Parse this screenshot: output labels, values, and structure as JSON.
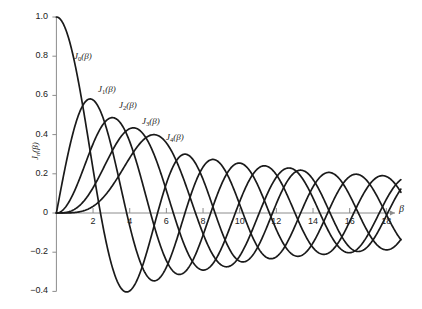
{
  "figure": {
    "title": "",
    "background_color": "#ffffff",
    "curve_color": "#1a1a1a",
    "axis_color": "#8c8c8c"
  },
  "axes": {
    "x": {
      "label": "β",
      "ticks": [
        2,
        4,
        6,
        8,
        10,
        12,
        14,
        16,
        18
      ],
      "tick_labels": [
        "2",
        "4",
        "6",
        "8",
        "10",
        "12",
        "14",
        "16",
        "18"
      ],
      "range": [
        0,
        18.8
      ]
    },
    "y": {
      "label_parts": {
        "J": "J",
        "sub": "n",
        "arg": "(β)"
      },
      "label": "Jₙ(β)",
      "ticks": [
        1.0,
        0.8,
        0.6,
        0.4,
        0.2,
        0,
        -0.2,
        -0.4
      ],
      "tick_labels": [
        "1.0",
        "0.8",
        "0.6",
        "0.4",
        "0.2",
        "0",
        "−0.2",
        "−0.4"
      ],
      "range": [
        -0.43,
        1.04
      ]
    }
  },
  "curve_labels": [
    {
      "name": "J0",
      "text": "J₀(β)",
      "base": "J",
      "sub": "0",
      "arg": "(β)",
      "x": 74,
      "y": 52
    },
    {
      "name": "J1",
      "text": "J₁(β)",
      "base": "J",
      "sub": "1",
      "arg": "(β)",
      "x": 98,
      "y": 85
    },
    {
      "name": "J2",
      "text": "J₂(β)",
      "base": "J",
      "sub": "2",
      "arg": "(β)",
      "x": 119,
      "y": 101
    },
    {
      "name": "J3",
      "text": "J₃(β)",
      "base": "J",
      "sub": "3",
      "arg": "(β)",
      "x": 142,
      "y": 117
    },
    {
      "name": "J4",
      "text": "J₄(β)",
      "base": "J",
      "sub": "4",
      "arg": "(β)",
      "x": 166,
      "y": 133
    }
  ],
  "chart_data": {
    "type": "line",
    "xlabel": "β",
    "ylabel": "Jₙ(β)",
    "xlim": [
      0,
      18.8
    ],
    "ylim": [
      -0.43,
      1.04
    ],
    "grid": false,
    "legend": "inline-curve-labels",
    "x_ticks": [
      2,
      4,
      6,
      8,
      10,
      12,
      14,
      16,
      18
    ],
    "y_ticks": [
      1.0,
      0.8,
      0.6,
      0.4,
      0.2,
      0,
      -0.2,
      -0.4
    ],
    "series": [
      {
        "name": "J0(β)",
        "order": 0,
        "first_max": {
          "x": 0,
          "y": 1.0
        },
        "zeros": [
          2.405,
          5.52,
          8.654,
          11.792,
          14.931,
          18.071
        ],
        "sample_points": [
          {
            "x": 0,
            "y": 1.0
          },
          {
            "x": 1,
            "y": 0.765
          },
          {
            "x": 2,
            "y": 0.224
          },
          {
            "x": 3,
            "y": -0.26
          },
          {
            "x": 4,
            "y": -0.397
          },
          {
            "x": 5,
            "y": -0.178
          },
          {
            "x": 6,
            "y": 0.151
          },
          {
            "x": 7,
            "y": 0.3
          },
          {
            "x": 8,
            "y": 0.172
          },
          {
            "x": 9,
            "y": -0.09
          },
          {
            "x": 10,
            "y": -0.246
          },
          {
            "x": 11,
            "y": -0.171
          },
          {
            "x": 12,
            "y": 0.048
          },
          {
            "x": 13,
            "y": 0.207
          },
          {
            "x": 14,
            "y": 0.171
          },
          {
            "x": 15,
            "y": -0.014
          },
          {
            "x": 16,
            "y": -0.175
          },
          {
            "x": 17,
            "y": -0.17
          },
          {
            "x": 18,
            "y": -0.013
          }
        ]
      },
      {
        "name": "J1(β)",
        "order": 1,
        "first_max": {
          "x": 1.841,
          "y": 0.581
        },
        "zeros": [
          0,
          3.832,
          7.016,
          10.174,
          13.324,
          16.471
        ],
        "sample_points": [
          {
            "x": 0,
            "y": 0.0
          },
          {
            "x": 1,
            "y": 0.44
          },
          {
            "x": 2,
            "y": 0.577
          },
          {
            "x": 3,
            "y": 0.339
          },
          {
            "x": 4,
            "y": -0.066
          },
          {
            "x": 5,
            "y": -0.328
          },
          {
            "x": 6,
            "y": -0.277
          },
          {
            "x": 7,
            "y": -0.005
          },
          {
            "x": 8,
            "y": 0.235
          },
          {
            "x": 9,
            "y": 0.245
          },
          {
            "x": 10,
            "y": 0.043
          },
          {
            "x": 11,
            "y": -0.177
          },
          {
            "x": 12,
            "y": -0.223
          },
          {
            "x": 13,
            "y": -0.07
          },
          {
            "x": 14,
            "y": 0.133
          },
          {
            "x": 15,
            "y": 0.205
          },
          {
            "x": 16,
            "y": 0.09
          },
          {
            "x": 17,
            "y": -0.098
          },
          {
            "x": 18,
            "y": -0.188
          }
        ]
      },
      {
        "name": "J2(β)",
        "order": 2,
        "first_max": {
          "x": 3.054,
          "y": 0.486
        },
        "zeros": [
          0,
          5.136,
          8.417,
          11.62,
          14.796,
          17.96
        ],
        "sample_points": [
          {
            "x": 0,
            "y": 0.0
          },
          {
            "x": 1,
            "y": 0.115
          },
          {
            "x": 2,
            "y": 0.353
          },
          {
            "x": 3,
            "y": 0.486
          },
          {
            "x": 4,
            "y": 0.364
          },
          {
            "x": 5,
            "y": 0.047
          },
          {
            "x": 6,
            "y": -0.243
          },
          {
            "x": 7,
            "y": -0.301
          },
          {
            "x": 8,
            "y": -0.113
          },
          {
            "x": 9,
            "y": 0.145
          },
          {
            "x": 10,
            "y": 0.255
          },
          {
            "x": 11,
            "y": 0.139
          },
          {
            "x": 12,
            "y": -0.085
          },
          {
            "x": 13,
            "y": -0.218
          },
          {
            "x": 14,
            "y": -0.152
          },
          {
            "x": 15,
            "y": 0.042
          },
          {
            "x": 16,
            "y": 0.186
          },
          {
            "x": 17,
            "y": 0.158
          },
          {
            "x": 18,
            "y": -0.008
          }
        ]
      },
      {
        "name": "J3(β)",
        "order": 3,
        "first_max": {
          "x": 4.201,
          "y": 0.434
        },
        "zeros": [
          0,
          6.38,
          9.761,
          13.015,
          16.223
        ],
        "sample_points": [
          {
            "x": 0,
            "y": 0.0
          },
          {
            "x": 1,
            "y": 0.02
          },
          {
            "x": 2,
            "y": 0.129
          },
          {
            "x": 3,
            "y": 0.309
          },
          {
            "x": 4,
            "y": 0.43
          },
          {
            "x": 5,
            "y": 0.365
          },
          {
            "x": 6,
            "y": 0.115
          },
          {
            "x": 7,
            "y": -0.168
          },
          {
            "x": 8,
            "y": -0.291
          },
          {
            "x": 9,
            "y": -0.181
          },
          {
            "x": 10,
            "y": 0.058
          },
          {
            "x": 11,
            "y": 0.227
          },
          {
            "x": 12,
            "y": 0.195
          },
          {
            "x": 13,
            "y": 0.003
          },
          {
            "x": 14,
            "y": -0.177
          },
          {
            "x": 15,
            "y": -0.194
          },
          {
            "x": 16,
            "y": -0.043
          },
          {
            "x": 17,
            "y": 0.135
          },
          {
            "x": 18,
            "y": 0.186
          }
        ]
      },
      {
        "name": "J4(β)",
        "order": 4,
        "first_max": {
          "x": 5.318,
          "y": 0.391
        },
        "zeros": [
          0,
          7.588,
          11.065,
          14.373,
          17.616
        ],
        "sample_points": [
          {
            "x": 0,
            "y": 0.0
          },
          {
            "x": 1,
            "y": 0.002
          },
          {
            "x": 2,
            "y": 0.034
          },
          {
            "x": 3,
            "y": 0.132
          },
          {
            "x": 4,
            "y": 0.281
          },
          {
            "x": 5,
            "y": 0.391
          },
          {
            "x": 6,
            "y": 0.358
          },
          {
            "x": 7,
            "y": 0.158
          },
          {
            "x": 8,
            "y": -0.105
          },
          {
            "x": 9,
            "y": -0.265
          },
          {
            "x": 10,
            "y": -0.22
          },
          {
            "x": 11,
            "y": -0.015
          },
          {
            "x": 12,
            "y": 0.182
          },
          {
            "x": 13,
            "y": 0.219
          },
          {
            "x": 14,
            "y": 0.076
          },
          {
            "x": 15,
            "y": -0.119
          },
          {
            "x": 16,
            "y": -0.202
          },
          {
            "x": 17,
            "y": -0.11
          },
          {
            "x": 18,
            "y": 0.069
          }
        ]
      }
    ]
  }
}
